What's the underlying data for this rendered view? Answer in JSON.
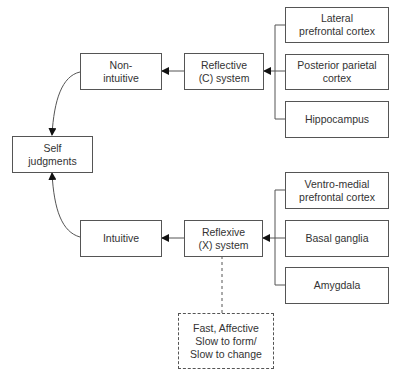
{
  "diagram": {
    "nodes": {
      "self_judgments": "Self\njudgments",
      "non_intuitive": "Non-\nintuitive",
      "intuitive": "Intuitive",
      "reflective": "Reflective\n(C) system",
      "reflexive": "Reflexive\n(X) system",
      "lateral_pfc": "Lateral\nprefrontal cortex",
      "posterior_parietal": "Posterior parietal\ncortex",
      "hippocampus": "Hippocampus",
      "vmpfc": "Ventro-medial\nprefrontal cortex",
      "basal_ganglia": "Basal ganglia",
      "amygdala": "Amygdala",
      "x_system_note": "Fast, Affective\nSlow to form/\nSlow to change"
    },
    "edges": [
      {
        "from": "lateral_pfc",
        "to": "reflective"
      },
      {
        "from": "posterior_parietal",
        "to": "reflective"
      },
      {
        "from": "hippocampus",
        "to": "reflective"
      },
      {
        "from": "reflective",
        "to": "non_intuitive"
      },
      {
        "from": "non_intuitive",
        "to": "self_judgments"
      },
      {
        "from": "vmpfc",
        "to": "reflexive"
      },
      {
        "from": "basal_ganglia",
        "to": "reflexive"
      },
      {
        "from": "amygdala",
        "to": "reflexive"
      },
      {
        "from": "reflexive",
        "to": "intuitive"
      },
      {
        "from": "intuitive",
        "to": "self_judgments"
      },
      {
        "from": "reflexive",
        "to": "x_system_note",
        "style": "dashed"
      }
    ]
  }
}
